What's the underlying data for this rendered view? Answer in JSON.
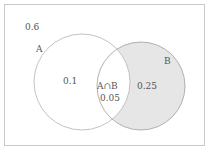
{
  "diagram": {
    "type": "venn",
    "universe_value": "0.6",
    "sets": [
      {
        "name": "A",
        "only_value": "0.1"
      },
      {
        "name": "B",
        "only_value": "0.25",
        "shaded": true
      }
    ],
    "intersection": {
      "label": "A∩B",
      "value": "0.05"
    },
    "colors": {
      "border": "#c8c8c8",
      "circle": "#b4b4b4",
      "shade": "#e6e6e6",
      "text": "#555555"
    }
  }
}
